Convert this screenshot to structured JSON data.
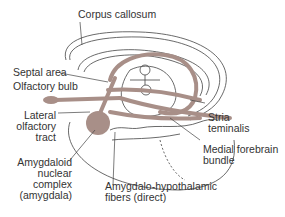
{
  "diagram": {
    "labels": {
      "corpus_callosum": "Corpus callosum",
      "septal_area": "Septal area",
      "olfactory_bulb": "Olfactory bulb",
      "lateral_olfactory_tract": [
        "Lateral",
        "olfactory",
        "tract"
      ],
      "amygdaloid": [
        "Amygdaloid",
        "nuclear",
        "complex",
        "(amygdala)"
      ],
      "amygdalo_hypothalamic": [
        "Amygdalo-hypothalamic",
        "fibers (direct)"
      ],
      "stria_terminalis": [
        "Stria",
        "teminalis"
      ],
      "medial_forebrain_bundle": [
        "Medial forebrain",
        "bundle"
      ]
    },
    "colors": {
      "pathway": "#a88f88",
      "outline": "#444444",
      "text": "#333333"
    }
  }
}
